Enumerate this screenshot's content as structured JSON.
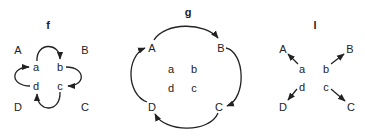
{
  "panels": [
    {
      "id": "f",
      "title": "f",
      "outer_labels": {
        "A": "A",
        "B": "B",
        "C": "C",
        "D": "D"
      },
      "inner_labels": {
        "a": "a",
        "b": "b",
        "c": "c",
        "d": "d"
      },
      "edges": [
        {
          "from": "a",
          "to": "b",
          "shape": "arc-top"
        },
        {
          "from": "b",
          "to": "c",
          "shape": "arc-right"
        },
        {
          "from": "c",
          "to": "d",
          "shape": "arc-bottom"
        },
        {
          "from": "d",
          "to": "a",
          "shape": "arc-left"
        }
      ]
    },
    {
      "id": "g",
      "title": "g",
      "outer_labels": {
        "A": "A",
        "B": "B",
        "C": "C",
        "D": "D"
      },
      "inner_labels": {
        "a": "a",
        "b": "b",
        "c": "c",
        "d": "d"
      },
      "edges": [
        {
          "from": "A",
          "to": "B",
          "shape": "arc-top"
        },
        {
          "from": "B",
          "to": "C",
          "shape": "arc-right"
        },
        {
          "from": "C",
          "to": "D",
          "shape": "arc-bottom"
        },
        {
          "from": "D",
          "to": "A",
          "shape": "arc-left"
        }
      ]
    },
    {
      "id": "l",
      "title": "l",
      "outer_labels": {
        "A": "A",
        "B": "B",
        "C": "C",
        "D": "D"
      },
      "inner_labels": {
        "a": "a",
        "b": "b",
        "c": "c",
        "d": "d"
      },
      "edges": [
        {
          "from": "a",
          "to": "A",
          "shape": "straight"
        },
        {
          "from": "b",
          "to": "B",
          "shape": "straight"
        },
        {
          "from": "c",
          "to": "C",
          "shape": "straight"
        },
        {
          "from": "d",
          "to": "D",
          "shape": "straight"
        }
      ]
    }
  ],
  "colors": {
    "ink": "#222222",
    "background": "#ffffff"
  }
}
